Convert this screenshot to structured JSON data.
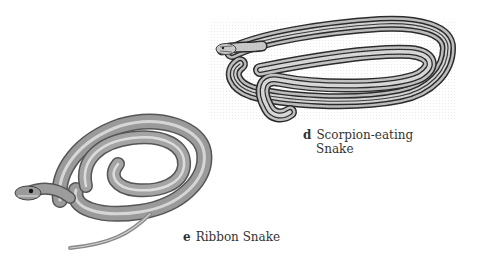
{
  "plate": {
    "illustrations": [
      {
        "id": "d",
        "letter": "d",
        "name_line1": "Scorpion-eating",
        "name_line2": "Snake",
        "pattern": "longitudinal dark stripes on light gray",
        "colors": {
          "body": "#b8b8b8",
          "stripe": "#2a2a2a",
          "light": "#e2e2e2"
        }
      },
      {
        "id": "e",
        "letter": "e",
        "name": "Ribbon Snake",
        "pattern": "slender with pale lateral stripes",
        "colors": {
          "body": "#8e8e8e",
          "stripe": "#d6d6d6",
          "dark": "#4a4a4a"
        }
      }
    ]
  }
}
